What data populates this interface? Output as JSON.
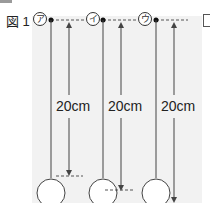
{
  "figure": {
    "label": "図 1",
    "pendulums": [
      {
        "marker": "ア",
        "length_label": "20cm"
      },
      {
        "marker": "イ",
        "length_label": "20cm"
      },
      {
        "marker": "ウ",
        "length_label": "20cm"
      }
    ]
  },
  "colors": {
    "panel": "#f2f2f2",
    "line": "#444444",
    "dashed": "#555555"
  }
}
